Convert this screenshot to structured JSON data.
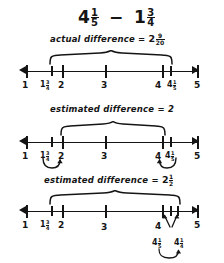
{
  "title": {
    "minuend_whole": "4",
    "minuend_num": "1",
    "minuend_den": "5",
    "operator": "−",
    "subtrahend_whole": "1",
    "subtrahend_num": "3",
    "subtrahend_den": "4"
  },
  "lines": [
    {
      "id": "actual",
      "caption_text": "actual difference =",
      "caption_whole": "2",
      "caption_num": "9",
      "caption_den": "20",
      "labels": [
        {
          "text": "1"
        },
        {
          "whole": "1",
          "num": "3",
          "den": "4"
        },
        {
          "text": "2"
        },
        {
          "text": "3"
        },
        {
          "text": "4"
        },
        {
          "whole": "4",
          "num": "1",
          "den": "5"
        },
        {
          "text": "5"
        }
      ]
    },
    {
      "id": "estimate-whole",
      "caption_text": "estimated difference = 2",
      "caption_whole": "",
      "caption_num": "",
      "caption_den": "",
      "labels": [
        {
          "text": "1"
        },
        {
          "whole": "1",
          "num": "3",
          "den": "4"
        },
        {
          "text": "2"
        },
        {
          "text": "3"
        },
        {
          "text": "4"
        },
        {
          "whole": "4",
          "num": "1",
          "den": "5"
        },
        {
          "text": "5"
        }
      ]
    },
    {
      "id": "estimate-half",
      "caption_text": "estimated difference =",
      "caption_whole": "2",
      "caption_num": "1",
      "caption_den": "2",
      "labels": [
        {
          "text": "1"
        },
        {
          "whole": "1",
          "num": "3",
          "den": "4"
        },
        {
          "text": "2"
        },
        {
          "text": "3"
        },
        {
          "text": "4"
        },
        {
          "whole": "4",
          "num": "1",
          "den": "5"
        },
        {
          "whole": "4",
          "num": "1",
          "den": "4"
        },
        {
          "text": "5"
        }
      ]
    }
  ]
}
